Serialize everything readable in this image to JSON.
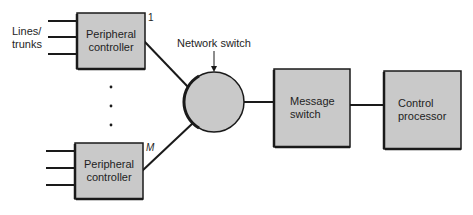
{
  "diagram": {
    "colors": {
      "fill": "#c9c9c9",
      "stroke": "#1a1a1a",
      "text": "#1e1e1e",
      "background": "#ffffff"
    },
    "input_label": "Lines/\ntrunks",
    "input_label_line1": "Lines/",
    "input_label_line2": "trunks",
    "peripheral_controllers": [
      {
        "label_line1": "Peripheral",
        "label_line2": "controller",
        "index": "1"
      },
      {
        "label_line1": "Peripheral",
        "label_line2": "controller",
        "index": "M"
      }
    ],
    "ellipsis": "· · ·",
    "network_switch": {
      "label": "Network switch"
    },
    "message_switch": {
      "label_line1": "Message",
      "label_line2": "switch"
    },
    "control_processor": {
      "label_line1": "Control",
      "label_line2": "processor"
    }
  }
}
